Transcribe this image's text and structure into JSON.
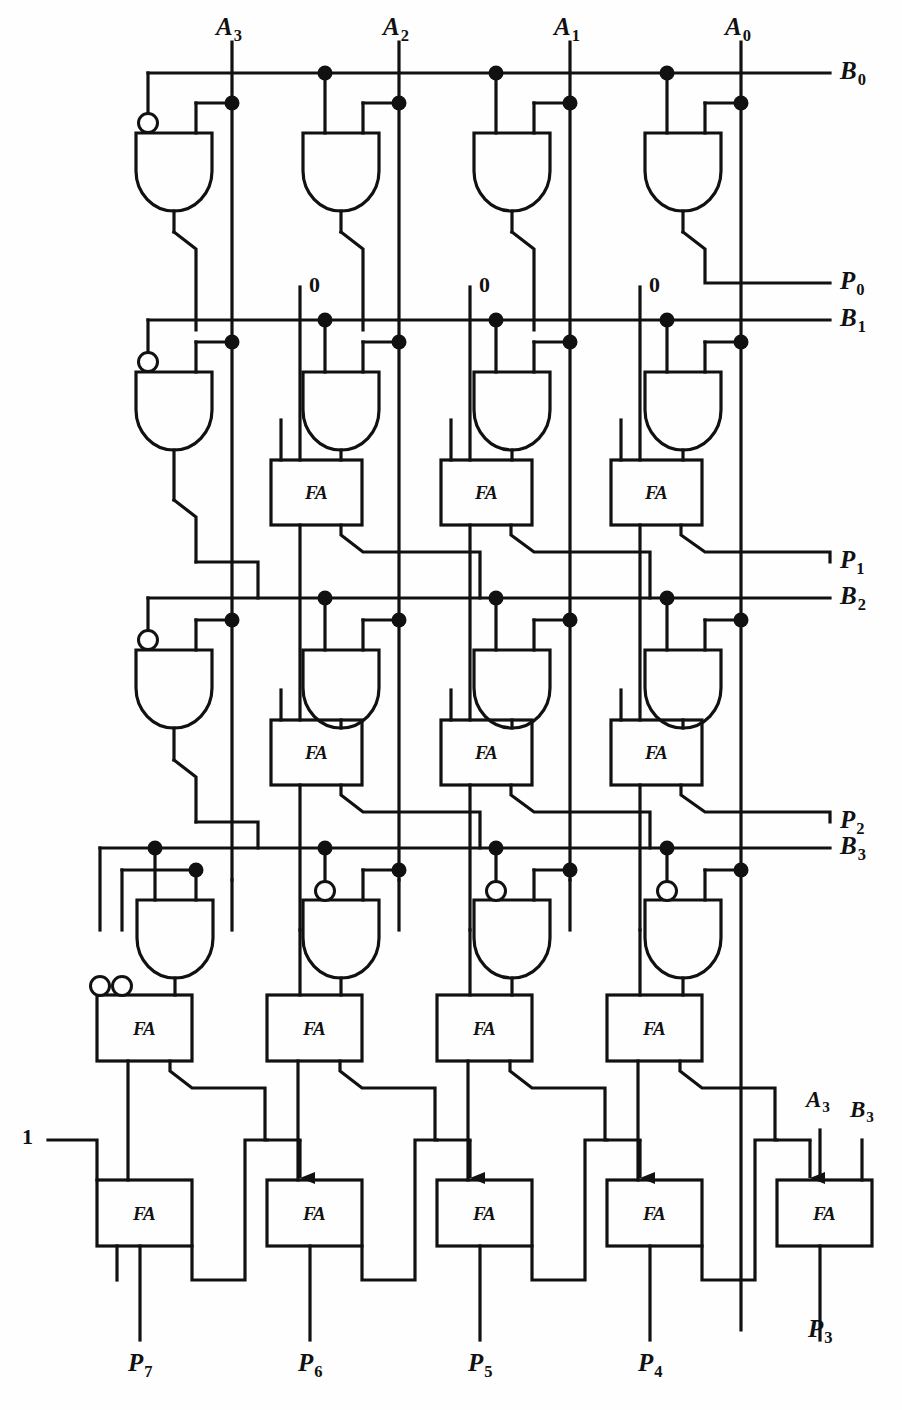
{
  "figure": {
    "type": "logic-circuit-schematic",
    "ink_color": "#111111",
    "background_color": "#fefefe",
    "block_label": "FA",
    "block_label_full": "Full Adder"
  },
  "inputs_top": [
    {
      "name": "A3",
      "base": "A",
      "sub": "3",
      "x": 232
    },
    {
      "name": "A2",
      "base": "A",
      "sub": "2",
      "x": 399
    },
    {
      "name": "A1",
      "base": "A",
      "sub": "1",
      "x": 570
    },
    {
      "name": "A0",
      "base": "A",
      "sub": "0",
      "x": 741
    }
  ],
  "bus_labels_right": [
    {
      "name": "B0",
      "base": "B",
      "sub": "0",
      "y": 73
    },
    {
      "name": "B1",
      "base": "B",
      "sub": "1",
      "y": 320
    },
    {
      "name": "B2",
      "base": "B",
      "sub": "2",
      "y": 598
    },
    {
      "name": "B3",
      "base": "B",
      "sub": "3",
      "y": 848
    }
  ],
  "partial_product_outputs": [
    {
      "name": "P0",
      "base": "P",
      "sub": "0",
      "y": 283
    },
    {
      "name": "P1",
      "base": "P",
      "sub": "1",
      "y": 562
    },
    {
      "name": "P2",
      "base": "P",
      "sub": "2",
      "y": 822
    }
  ],
  "bottom_outputs": [
    {
      "name": "P7",
      "base": "P",
      "sub": "7",
      "x": 140
    },
    {
      "name": "P6",
      "base": "P",
      "sub": "6",
      "x": 310
    },
    {
      "name": "P5",
      "base": "P",
      "sub": "5",
      "x": 480
    },
    {
      "name": "P4",
      "base": "P",
      "sub": "4",
      "x": 650
    },
    {
      "name": "P3",
      "base": "P",
      "sub": "3",
      "x": 820
    }
  ],
  "constant_inputs": [
    {
      "value": "0",
      "x": 300,
      "y": 288
    },
    {
      "value": "0",
      "x": 470,
      "y": 288
    },
    {
      "value": "0",
      "x": 640,
      "y": 288
    },
    {
      "value": "1",
      "x": 27,
      "y": 1141
    }
  ],
  "final_adder_inputs": [
    {
      "name": "A3",
      "base": "A",
      "sub": "3",
      "x": 820
    },
    {
      "name": "B3",
      "base": "B",
      "sub": "3",
      "x": 862
    }
  ],
  "gate_rows": [
    {
      "bus": "B0",
      "gates": 4,
      "inverted_inputs": [
        "left on gate 1 only"
      ]
    },
    {
      "bus": "B1",
      "gates": 4,
      "inverted_inputs": [
        "left on gate 1 only"
      ]
    },
    {
      "bus": "B2",
      "gates": 4,
      "inverted_inputs": [
        "left on gate 1 only"
      ]
    },
    {
      "bus": "B3",
      "gates": 4,
      "inverted_inputs": [
        "left on gates 2, 3 and 4"
      ]
    }
  ],
  "counts": {
    "and_gates": 16,
    "full_adders": 13,
    "inverting_bubbles_on_gates": 6,
    "inverting_bubbles_on_adders": 2
  }
}
